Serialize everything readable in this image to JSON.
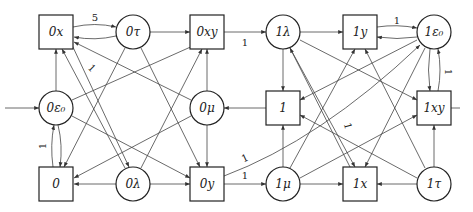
{
  "diagram": {
    "nodes": [
      {
        "id": "0x",
        "label": "0x",
        "shape": "square",
        "x": 56,
        "y": 32
      },
      {
        "id": "0tau",
        "label": "0τ",
        "shape": "circle",
        "x": 133,
        "y": 32
      },
      {
        "id": "0xy",
        "label": "0xy",
        "shape": "square",
        "x": 207,
        "y": 32
      },
      {
        "id": "1lambda",
        "label": "1λ",
        "shape": "circle",
        "x": 283,
        "y": 32
      },
      {
        "id": "1y",
        "label": "1y",
        "shape": "square",
        "x": 360,
        "y": 32
      },
      {
        "id": "1eps0",
        "label": "1ε₀",
        "shape": "circle",
        "x": 434,
        "y": 32
      },
      {
        "id": "0eps0",
        "label": "0ε₀",
        "shape": "circle",
        "x": 56,
        "y": 108
      },
      {
        "id": "0mu",
        "label": "0μ",
        "shape": "circle",
        "x": 207,
        "y": 108
      },
      {
        "id": "1",
        "label": "1",
        "shape": "square",
        "x": 283,
        "y": 108
      },
      {
        "id": "1xy",
        "label": "1xy",
        "shape": "square",
        "x": 434,
        "y": 108
      },
      {
        "id": "0",
        "label": "0",
        "shape": "square",
        "x": 56,
        "y": 184
      },
      {
        "id": "0lambda",
        "label": "0λ",
        "shape": "circle",
        "x": 133,
        "y": 184
      },
      {
        "id": "0y",
        "label": "0y",
        "shape": "square",
        "x": 207,
        "y": 184
      },
      {
        "id": "1mu",
        "label": "1μ",
        "shape": "circle",
        "x": 283,
        "y": 184
      },
      {
        "id": "1x",
        "label": "1x",
        "shape": "square",
        "x": 360,
        "y": 184
      },
      {
        "id": "1tau",
        "label": "1τ",
        "shape": "circle",
        "x": 434,
        "y": 184
      }
    ],
    "edge_labels": [
      {
        "text": "5",
        "x": 95,
        "y": 18
      },
      {
        "text": "1",
        "x": 93,
        "y": 69,
        "rotate": 45
      },
      {
        "text": "1",
        "x": 245,
        "y": 42
      },
      {
        "text": "1",
        "x": 397,
        "y": 21
      },
      {
        "text": "1",
        "x": 447,
        "y": 72,
        "rotate": 90
      },
      {
        "text": "1",
        "x": 42,
        "y": 146,
        "rotate": -90
      },
      {
        "text": "1",
        "x": 350,
        "y": 125,
        "rotate": 75
      },
      {
        "text": "1",
        "x": 245,
        "y": 160,
        "rotate": -25
      },
      {
        "text": "1",
        "x": 245,
        "y": 175
      }
    ]
  }
}
